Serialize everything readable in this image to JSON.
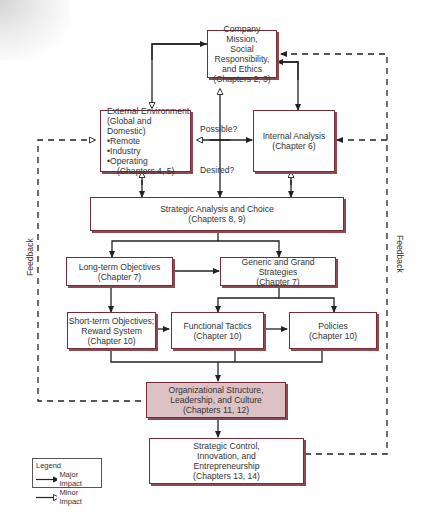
{
  "nodes": {
    "mission": {
      "lines": [
        "Company Mission,",
        "Social Responsibility,",
        "and Ethics",
        "(Chapters 2, 3)"
      ]
    },
    "external": {
      "title1": "External Environment",
      "title2": "(Global and Domestic)",
      "bullets": [
        "Remote",
        "Industry",
        "Operating"
      ],
      "chapters": "(Chapters 4, 5)"
    },
    "internal": {
      "lines": [
        "Internal Analysis",
        "(Chapter 6)"
      ]
    },
    "strategic": {
      "lines": [
        "Strategic Analysis and Choice",
        "(Chapters 8, 9)"
      ]
    },
    "longterm": {
      "lines": [
        "Long-term Objectives",
        "(Chapter 7)"
      ]
    },
    "generic": {
      "lines": [
        "Generic and Grand Strategies",
        "(Chapter 7)"
      ]
    },
    "shortterm": {
      "lines": [
        "Short-term Objectives;",
        "Reward System",
        "(Chapter 10)"
      ]
    },
    "functional": {
      "lines": [
        "Functional Tactics",
        "(Chapter 10)"
      ]
    },
    "policies": {
      "lines": [
        "Policies",
        "(Chapter 10)"
      ]
    },
    "org": {
      "lines": [
        "Organizational Structure,",
        "Leadership, and Culture",
        "(Chapters 11, 12)"
      ]
    },
    "control": {
      "lines": [
        "Strategic Control,",
        "Innovation, and",
        "Entrepreneurship",
        "(Chapters 13, 14)"
      ]
    }
  },
  "labels": {
    "possible": "Possible?",
    "desired": "Desired?",
    "feedback_left": "Feedback",
    "feedback_right": "Feedback"
  },
  "legend": {
    "title": "Legend",
    "major": "Major Impact",
    "minor": "Minor Impact"
  },
  "colors": {
    "box_border": "#7a2a33",
    "highlight_fill": "#dcc2c5",
    "line": "#222222"
  }
}
